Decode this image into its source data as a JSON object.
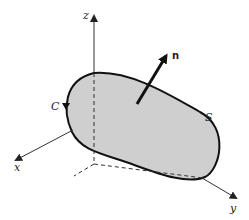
{
  "diagram": {
    "type": "surface-with-boundary",
    "labels": {
      "z_axis": "z",
      "x_axis": "x",
      "y_axis": "y",
      "normal": "n",
      "surface": "S",
      "curve": "C"
    },
    "colors": {
      "surface_fill": "#cfcfcf",
      "stroke": "#111111",
      "axis": "#333333"
    }
  }
}
